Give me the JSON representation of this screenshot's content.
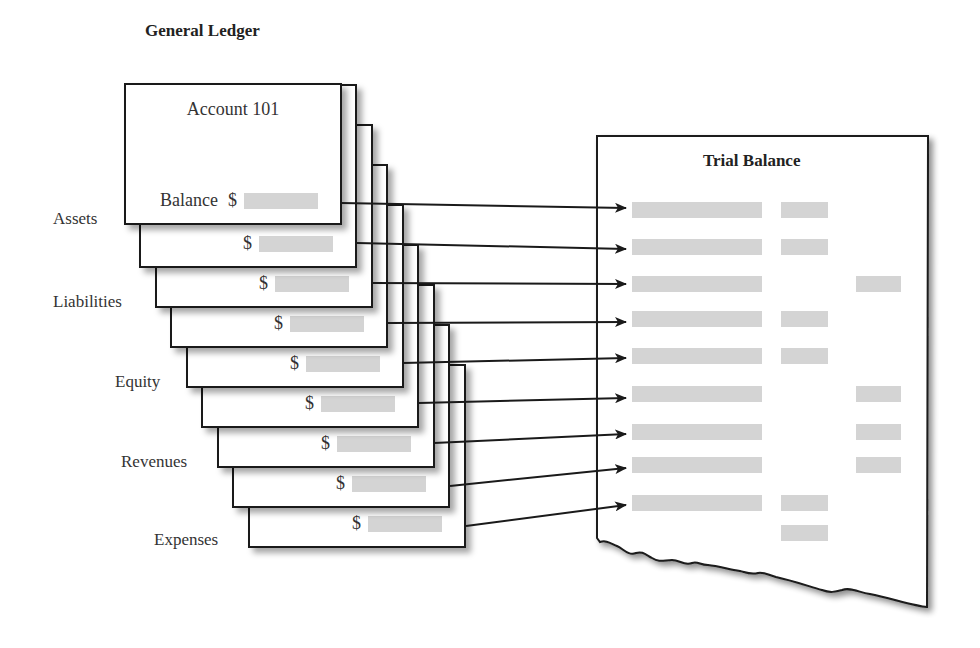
{
  "general_ledger": {
    "title": "General Ledger",
    "first_card": {
      "title": "Account 101",
      "balance_label": "Balance",
      "currency": "$"
    },
    "currency": "$",
    "card_count": 9,
    "categories": [
      {
        "label": "Assets"
      },
      {
        "label": "Liabilities"
      },
      {
        "label": "Equity"
      },
      {
        "label": "Revenues"
      },
      {
        "label": "Expenses"
      }
    ]
  },
  "trial_balance": {
    "title": "Trial Balance",
    "rows": [
      {
        "debit": true,
        "credit": false
      },
      {
        "debit": true,
        "credit": false
      },
      {
        "debit": false,
        "credit": true
      },
      {
        "debit": true,
        "credit": false
      },
      {
        "debit": true,
        "credit": false
      },
      {
        "debit": false,
        "credit": true
      },
      {
        "debit": false,
        "credit": true
      },
      {
        "debit": false,
        "credit": true
      },
      {
        "debit": true,
        "credit": false
      }
    ],
    "total_row": {
      "debit": true,
      "credit": false
    }
  },
  "colors": {
    "line": "#1a1a1a",
    "placeholder_bar": "#d4d4d4",
    "background": "#ffffff"
  }
}
